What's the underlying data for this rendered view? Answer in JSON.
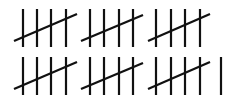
{
  "figure": {
    "description": "Tally marks",
    "total_count": 31,
    "stroke_color": "#111111",
    "background_color": "#ffffff",
    "stroke_width": 2.2
  },
  "rows": [
    {
      "label": "row-1",
      "count": 15,
      "y_top": 9,
      "y_bottom": 47,
      "groups": [
        {
          "strokes": [
            23,
            37,
            51,
            66
          ],
          "slash": [
            14,
            41,
            77,
            14
          ]
        },
        {
          "strokes": [
            90,
            104,
            119,
            133
          ],
          "slash": [
            81,
            41,
            143,
            15
          ]
        },
        {
          "strokes": [
            156,
            171,
            185,
            200
          ],
          "slash": [
            148,
            41,
            210,
            14
          ]
        }
      ],
      "singles": []
    },
    {
      "label": "row-2",
      "count": 16,
      "y_top": 57,
      "y_bottom": 95,
      "groups": [
        {
          "strokes": [
            23,
            37,
            51,
            66
          ],
          "slash": [
            14,
            89,
            77,
            62
          ]
        },
        {
          "strokes": [
            90,
            104,
            119,
            133
          ],
          "slash": [
            81,
            89,
            143,
            63
          ]
        },
        {
          "strokes": [
            156,
            171,
            185,
            200
          ],
          "slash": [
            148,
            89,
            210,
            62
          ]
        }
      ],
      "singles": [
        221
      ]
    }
  ]
}
